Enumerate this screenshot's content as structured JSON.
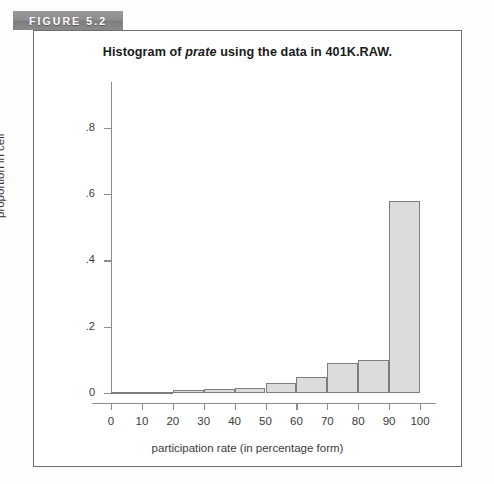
{
  "figure": {
    "tab_label": "FIGURE 5.2"
  },
  "chart_data": {
    "type": "bar",
    "title": "Histogram of prate using the data in 401K.RAW.",
    "title_parts": {
      "before": "Histogram of ",
      "italic": "prate",
      "after": " using the data in 401K.RAW."
    },
    "xlabel": "participation rate (in percentage form)",
    "ylabel": "proportion in cell",
    "xlim": [
      0,
      100
    ],
    "ylim": [
      0,
      0.9
    ],
    "grid": false,
    "legend": null,
    "xticks": [
      "0",
      "10",
      "20",
      "30",
      "40",
      "50",
      "60",
      "70",
      "80",
      "90",
      "100"
    ],
    "xtick_values": [
      0,
      10,
      20,
      30,
      40,
      50,
      60,
      70,
      80,
      90,
      100
    ],
    "yticks": [
      "0",
      ".2",
      ".4",
      ".6",
      ".8"
    ],
    "ytick_values": [
      0,
      0.2,
      0.4,
      0.6,
      0.8
    ],
    "bin_edges": [
      0,
      10,
      20,
      30,
      40,
      50,
      60,
      70,
      80,
      90,
      100
    ],
    "categories": [
      "0-10",
      "10-20",
      "20-30",
      "30-40",
      "40-50",
      "50-60",
      "60-70",
      "70-80",
      "80-90",
      "90-100"
    ],
    "values": [
      0.0,
      0.002,
      0.01,
      0.012,
      0.015,
      0.03,
      0.048,
      0.09,
      0.1,
      0.58
    ],
    "bar_fill": "#dcdcdc",
    "bar_edge": "#7d7d7d"
  },
  "colors": {
    "tab_background": "#8a8a8a",
    "tab_text": "#ffffff",
    "frame_border": "#6e6e6e",
    "axis": "#8d8d8d",
    "text": "#3a3a3a",
    "page_background": "#fdfdfc"
  }
}
